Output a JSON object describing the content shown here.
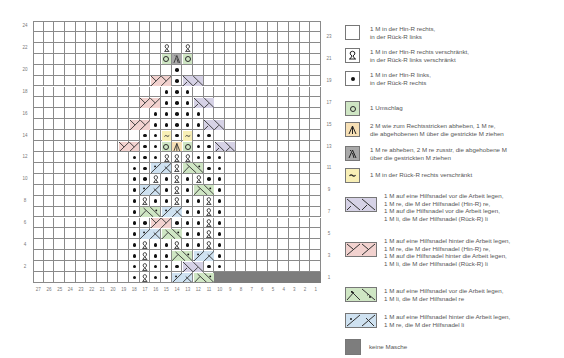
{
  "chart": {
    "columns": 27,
    "rows": 24,
    "left_row_labels": [
      "24",
      "22",
      "20",
      "18",
      "16",
      "14",
      "12",
      "10",
      "8",
      "6",
      "4",
      "2"
    ],
    "right_row_labels": [
      "23",
      "21",
      "19",
      "17",
      "15",
      "13",
      "11",
      "9",
      "7",
      "5",
      "3",
      "1"
    ],
    "column_labels": [
      "27",
      "26",
      "25",
      "24",
      "23",
      "22",
      "21",
      "20",
      "19",
      "18",
      "17",
      "16",
      "15",
      "14",
      "13",
      "12",
      "11",
      "10",
      "9",
      "8",
      "7",
      "6",
      "5",
      "4",
      "3",
      "2",
      "1"
    ],
    "colors": {
      "grid": "#8a8a8a",
      "yo_green": "#cfe6c4",
      "dec_orange": "#f7e0b5",
      "dec_gray": "#a9a9a9",
      "twist_yellow": "#f8efb6",
      "cross_purple": "#d6d2e6",
      "cross_pink": "#f2d2cf",
      "cross_green": "#cfe6c4",
      "cross_blue": "#cfe2f1",
      "no_stitch": "#7d7d7d"
    },
    "cells": [
      {
        "row": 22,
        "col": 15,
        "s": "tbl"
      },
      {
        "row": 22,
        "col": 13,
        "s": "tbl"
      },
      {
        "row": 21,
        "col": 15,
        "s": "yo"
      },
      {
        "row": 21,
        "col": 14,
        "s": "dec_gray"
      },
      {
        "row": 21,
        "col": 13,
        "s": "yo"
      },
      {
        "row": 20,
        "col": 14,
        "s": "p"
      },
      {
        "row": 19,
        "col": 16,
        "s": "cross_pink",
        "w": 2
      },
      {
        "row": 19,
        "col": 14,
        "s": "p"
      },
      {
        "row": 19,
        "col": 13,
        "s": "cross_purple",
        "w": 2
      },
      {
        "row": 18,
        "col": 15,
        "s": "p"
      },
      {
        "row": 18,
        "col": 14,
        "s": "p"
      },
      {
        "row": 18,
        "col": 13,
        "s": "p"
      },
      {
        "row": 17,
        "col": 17,
        "s": "cross_pink",
        "w": 2
      },
      {
        "row": 17,
        "col": 15,
        "s": "p"
      },
      {
        "row": 17,
        "col": 14,
        "s": "p"
      },
      {
        "row": 17,
        "col": 13,
        "s": "p"
      },
      {
        "row": 17,
        "col": 12,
        "s": "cross_purple",
        "w": 2
      },
      {
        "row": 16,
        "col": 16,
        "s": "p"
      },
      {
        "row": 16,
        "col": 15,
        "s": "p"
      },
      {
        "row": 16,
        "col": 14,
        "s": "p"
      },
      {
        "row": 16,
        "col": 13,
        "s": "p"
      },
      {
        "row": 16,
        "col": 12,
        "s": "p"
      },
      {
        "row": 15,
        "col": 18,
        "s": "cross_pink",
        "w": 2
      },
      {
        "row": 15,
        "col": 16,
        "s": "p"
      },
      {
        "row": 15,
        "col": 15,
        "s": "p"
      },
      {
        "row": 15,
        "col": 14,
        "s": "p"
      },
      {
        "row": 15,
        "col": 13,
        "s": "p"
      },
      {
        "row": 15,
        "col": 12,
        "s": "p"
      },
      {
        "row": 15,
        "col": 11,
        "s": "cross_purple",
        "w": 2
      },
      {
        "row": 14,
        "col": 17,
        "s": "p"
      },
      {
        "row": 14,
        "col": 16,
        "s": "p"
      },
      {
        "row": 14,
        "col": 15,
        "s": "ws_tbl"
      },
      {
        "row": 14,
        "col": 14,
        "s": "p"
      },
      {
        "row": 14,
        "col": 13,
        "s": "ws_tbl"
      },
      {
        "row": 14,
        "col": 12,
        "s": "p"
      },
      {
        "row": 14,
        "col": 11,
        "s": "p"
      },
      {
        "row": 13,
        "col": 19,
        "s": "cross_pink",
        "w": 2
      },
      {
        "row": 13,
        "col": 17,
        "s": "p"
      },
      {
        "row": 13,
        "col": 16,
        "s": "p"
      },
      {
        "row": 13,
        "col": 15,
        "s": "yo"
      },
      {
        "row": 13,
        "col": 14,
        "s": "dec_orange"
      },
      {
        "row": 13,
        "col": 13,
        "s": "yo"
      },
      {
        "row": 13,
        "col": 12,
        "s": "p"
      },
      {
        "row": 13,
        "col": 11,
        "s": "p"
      },
      {
        "row": 13,
        "col": 10,
        "s": "cross_purple",
        "w": 2
      },
      {
        "row": 12,
        "col": 18,
        "s": "p"
      },
      {
        "row": 12,
        "col": 17,
        "s": "p"
      },
      {
        "row": 12,
        "col": 16,
        "s": "p"
      },
      {
        "row": 12,
        "col": 15,
        "s": "tbl"
      },
      {
        "row": 12,
        "col": 14,
        "s": "tbl"
      },
      {
        "row": 12,
        "col": 13,
        "s": "tbl"
      },
      {
        "row": 12,
        "col": 12,
        "s": "p"
      },
      {
        "row": 12,
        "col": 11,
        "s": "p"
      },
      {
        "row": 12,
        "col": 10,
        "s": "p"
      },
      {
        "row": 11,
        "col": 18,
        "s": "p"
      },
      {
        "row": 11,
        "col": 17,
        "s": "p"
      },
      {
        "row": 11,
        "col": 16,
        "s": "cross_blue",
        "w": 2
      },
      {
        "row": 11,
        "col": 14,
        "s": "tbl"
      },
      {
        "row": 11,
        "col": 13,
        "s": "cross_green",
        "w": 2
      },
      {
        "row": 11,
        "col": 11,
        "s": "p"
      },
      {
        "row": 11,
        "col": 10,
        "s": "p"
      },
      {
        "row": 10,
        "col": 18,
        "s": "p"
      },
      {
        "row": 10,
        "col": 17,
        "s": "p"
      },
      {
        "row": 10,
        "col": 16,
        "s": "tbl"
      },
      {
        "row": 10,
        "col": 15,
        "s": "p"
      },
      {
        "row": 10,
        "col": 14,
        "s": "tbl"
      },
      {
        "row": 10,
        "col": 13,
        "s": "p"
      },
      {
        "row": 10,
        "col": 12,
        "s": "tbl"
      },
      {
        "row": 10,
        "col": 11,
        "s": "p"
      },
      {
        "row": 10,
        "col": 10,
        "s": "p"
      },
      {
        "row": 9,
        "col": 18,
        "s": "p"
      },
      {
        "row": 9,
        "col": 17,
        "s": "cross_blue",
        "w": 2
      },
      {
        "row": 9,
        "col": 15,
        "s": "p"
      },
      {
        "row": 9,
        "col": 14,
        "s": "tbl"
      },
      {
        "row": 9,
        "col": 13,
        "s": "p"
      },
      {
        "row": 9,
        "col": 12,
        "s": "cross_green",
        "w": 2
      },
      {
        "row": 9,
        "col": 10,
        "s": "p"
      },
      {
        "row": 8,
        "col": 18,
        "s": "p"
      },
      {
        "row": 8,
        "col": 17,
        "s": "tbl"
      },
      {
        "row": 8,
        "col": 16,
        "s": "p"
      },
      {
        "row": 8,
        "col": 15,
        "s": "p"
      },
      {
        "row": 8,
        "col": 14,
        "s": "tbl"
      },
      {
        "row": 8,
        "col": 13,
        "s": "p"
      },
      {
        "row": 8,
        "col": 12,
        "s": "p"
      },
      {
        "row": 8,
        "col": 11,
        "s": "tbl"
      },
      {
        "row": 8,
        "col": 10,
        "s": "p"
      },
      {
        "row": 7,
        "col": 18,
        "s": "p"
      },
      {
        "row": 7,
        "col": 17,
        "s": "cross_green",
        "w": 2
      },
      {
        "row": 7,
        "col": 15,
        "s": "cross_blue",
        "w": 2
      },
      {
        "row": 7,
        "col": 13,
        "s": "p"
      },
      {
        "row": 7,
        "col": 12,
        "s": "p"
      },
      {
        "row": 7,
        "col": 11,
        "s": "tbl"
      },
      {
        "row": 7,
        "col": 10,
        "s": "p"
      },
      {
        "row": 6,
        "col": 18,
        "s": "p"
      },
      {
        "row": 6,
        "col": 17,
        "s": "p"
      },
      {
        "row": 6,
        "col": 16,
        "s": "cross_pink",
        "w": 2
      },
      {
        "row": 6,
        "col": 14,
        "s": "p"
      },
      {
        "row": 6,
        "col": 13,
        "s": "p"
      },
      {
        "row": 6,
        "col": 12,
        "s": "p"
      },
      {
        "row": 6,
        "col": 11,
        "s": "tbl"
      },
      {
        "row": 6,
        "col": 10,
        "s": "p"
      },
      {
        "row": 5,
        "col": 18,
        "s": "p"
      },
      {
        "row": 5,
        "col": 17,
        "s": "cross_blue",
        "w": 2
      },
      {
        "row": 5,
        "col": 15,
        "s": "cross_green",
        "w": 2
      },
      {
        "row": 5,
        "col": 13,
        "s": "p"
      },
      {
        "row": 5,
        "col": 12,
        "s": "p"
      },
      {
        "row": 5,
        "col": 11,
        "s": "tbl"
      },
      {
        "row": 5,
        "col": 10,
        "s": "p"
      },
      {
        "row": 4,
        "col": 18,
        "s": "p"
      },
      {
        "row": 4,
        "col": 17,
        "s": "tbl"
      },
      {
        "row": 4,
        "col": 16,
        "s": "p"
      },
      {
        "row": 4,
        "col": 15,
        "s": "p"
      },
      {
        "row": 4,
        "col": 14,
        "s": "tbl"
      },
      {
        "row": 4,
        "col": 13,
        "s": "p"
      },
      {
        "row": 4,
        "col": 12,
        "s": "p"
      },
      {
        "row": 4,
        "col": 11,
        "s": "tbl"
      },
      {
        "row": 4,
        "col": 10,
        "s": "p"
      },
      {
        "row": 3,
        "col": 18,
        "s": "p"
      },
      {
        "row": 3,
        "col": 17,
        "s": "tbl"
      },
      {
        "row": 3,
        "col": 16,
        "s": "p"
      },
      {
        "row": 3,
        "col": 15,
        "s": "p"
      },
      {
        "row": 3,
        "col": 14,
        "s": "cross_green",
        "w": 2
      },
      {
        "row": 3,
        "col": 12,
        "s": "cross_blue",
        "w": 2
      },
      {
        "row": 3,
        "col": 10,
        "s": "p"
      },
      {
        "row": 2,
        "col": 18,
        "s": "p"
      },
      {
        "row": 2,
        "col": 17,
        "s": "tbl"
      },
      {
        "row": 2,
        "col": 16,
        "s": "p"
      },
      {
        "row": 2,
        "col": 15,
        "s": "p"
      },
      {
        "row": 2,
        "col": 14,
        "s": "p"
      },
      {
        "row": 2,
        "col": 13,
        "s": "cross_purple",
        "w": 2
      },
      {
        "row": 2,
        "col": 11,
        "s": "p"
      },
      {
        "row": 2,
        "col": 10,
        "s": "p"
      },
      {
        "row": 1,
        "col": 18,
        "s": "p"
      },
      {
        "row": 1,
        "col": 17,
        "s": "tbl"
      },
      {
        "row": 1,
        "col": 16,
        "s": "p"
      },
      {
        "row": 1,
        "col": 15,
        "s": "p"
      },
      {
        "row": 1,
        "col": 14,
        "s": "cross_blue",
        "w": 2
      },
      {
        "row": 1,
        "col": 12,
        "s": "cross_green",
        "w": 2
      },
      {
        "row": 1,
        "col": 10,
        "s": "none"
      },
      {
        "row": 1,
        "col": 9,
        "s": "none"
      },
      {
        "row": 1,
        "col": 8,
        "s": "none"
      },
      {
        "row": 1,
        "col": 7,
        "s": "none"
      },
      {
        "row": 1,
        "col": 6,
        "s": "none"
      },
      {
        "row": 1,
        "col": 5,
        "s": "none"
      },
      {
        "row": 1,
        "col": 4,
        "s": "none"
      },
      {
        "row": 1,
        "col": 3,
        "s": "none"
      },
      {
        "row": 1,
        "col": 2,
        "s": "none"
      },
      {
        "row": 1,
        "col": 1,
        "s": "none"
      }
    ]
  },
  "legend": {
    "items": [
      {
        "symbol": "knit-square",
        "text": "1 M in der Hin-R rechts,\nin der Rück-R links"
      },
      {
        "symbol": "twisted-knit",
        "text": "1 M in der Hin-R rechts verschränkt,\nin der Rück-R links verschränkt"
      },
      {
        "symbol": "purl-dot",
        "text": "1 M in der Hin-R links,\nin der Rück-R rechts"
      },
      {
        "symbol": "yarn-over",
        "text": "1 Umschlag"
      },
      {
        "symbol": "double-decrease-center",
        "text": "2 M wie zum Rechtsstricken abheben, 1 M re,\ndie abgehobenen M über die gestrickte M ziehen"
      },
      {
        "symbol": "double-decrease-left",
        "text": "1 M re abheben, 2 M re zusstr, die abgehobene M\nüber die gestrickten M ziehen"
      },
      {
        "symbol": "ws-twisted-knit",
        "text": "1 M in der Rück-R rechts verschränkt"
      },
      {
        "symbol": "cross-purple",
        "text": "1 M auf eine Hilfsnadel vor die Arbeit legen,\n1 M re, die M der Hilfsnadel (Hin-R) re,\n1 M auf die Hilfsnadel vor die Arbeit legen,\n1 M li, die M der Hilfsnadel (Rück-R) li"
      },
      {
        "symbol": "cross-pink",
        "text": "1 M auf eine Hilfsnadel hinter die Arbeit legen,\n1 M re, die M der Hilfsnadel (Hin-R) re,\n1 M auf die Hilfsnadel hinter die Arbeit legen,\n1 M li, die M der Hilfsnadel (Rück-R) li"
      },
      {
        "symbol": "cross-green",
        "text": "1 M auf eine Hilfsnadel vor die Arbeit legen,\n1 M li, die M der Hilfsnadel re"
      },
      {
        "symbol": "cross-blue",
        "text": "1 M auf eine Hilfsnadel hinter die Arbeit legen,\n1 M re, die M der Hilfsnadel li"
      },
      {
        "symbol": "no-stitch",
        "text": "keine Masche"
      }
    ]
  }
}
